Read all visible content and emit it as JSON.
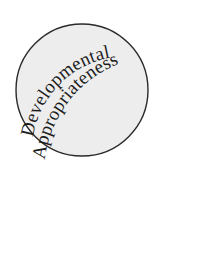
{
  "figure": {
    "name": "developmental-appropriateness-circle-diagram",
    "background_color": "#ffffff",
    "width": 224,
    "height": 258
  },
  "circle": {
    "label": "shaded circle",
    "fill_color": "#ededed",
    "stroke_color": "#2a2a2a",
    "stroke_width": 1.4,
    "center_x": 82,
    "center_y": 90,
    "radius": 66
  },
  "curved_text": {
    "line1": "Developmental",
    "line2": "Appropriateness",
    "color": "#1d1d1d",
    "font_size": 19,
    "arc1_radius": 96,
    "arc2_radius": 118
  }
}
